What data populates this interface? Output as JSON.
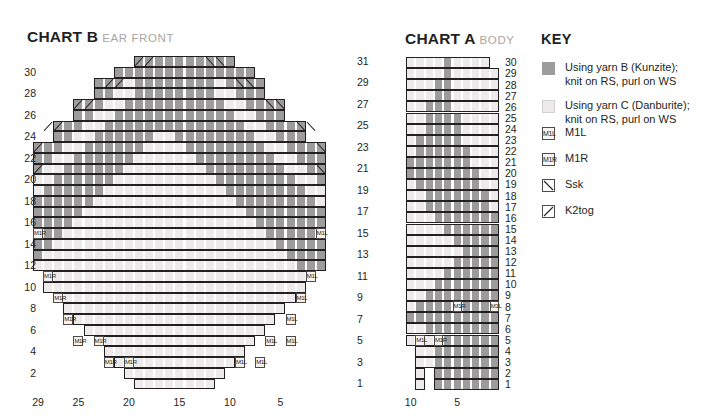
{
  "charts": [
    {
      "id": "chart-b",
      "title_main": "CHART B",
      "title_sub": "EAR FRONT",
      "left_labels": [
        "30",
        "28",
        "26",
        "24",
        "22",
        "20",
        "18",
        "16",
        "14",
        "12",
        "10",
        "8",
        "6",
        "4",
        "2"
      ],
      "right_labels": [
        "31",
        "29",
        "27",
        "25",
        "23",
        "21",
        "19",
        "17",
        "15",
        "13",
        "11",
        "9",
        "7",
        "5",
        "3",
        "1"
      ],
      "bottom_labels": [
        "29",
        "25",
        "20",
        "15",
        "10",
        "5"
      ],
      "columns": 29,
      "rows": 31
    },
    {
      "id": "chart-a",
      "title_main": "CHART A",
      "title_sub": "BODY",
      "right_labels": [
        "30",
        "29",
        "28",
        "27",
        "26",
        "25",
        "24",
        "23",
        "22",
        "21",
        "20",
        "19",
        "18",
        "17",
        "16",
        "15",
        "14",
        "13",
        "12",
        "11",
        "10",
        "9",
        "8",
        "7",
        "6",
        "5",
        "4",
        "3",
        "2",
        "1"
      ],
      "bottom_labels": [
        "10",
        "5"
      ],
      "columns": 10,
      "rows": 30
    }
  ],
  "key": {
    "title": "KEY",
    "items": [
      {
        "swatch": "yarn-b-swatch",
        "label": "Using yarn B (Kunzite);\nknit on RS, purl on WS",
        "line1": "Using yarn B (Kunzite);",
        "line2": "knit on RS, purl on WS"
      },
      {
        "swatch": "yarn-c-swatch",
        "label": "Using yarn C (Danburite);\nknit on RS, purl on WS",
        "line1": "Using yarn C (Danburite);",
        "line2": "knit on RS, purl on WS"
      },
      {
        "swatch": "m1l-symbol",
        "glyph": "M1L",
        "line1": "M1L",
        "line2": ""
      },
      {
        "swatch": "m1r-symbol",
        "glyph": "M1R",
        "line1": "M1R",
        "line2": ""
      },
      {
        "swatch": "ssk-symbol",
        "glyph": "backslash",
        "line1": "Ssk",
        "line2": ""
      },
      {
        "swatch": "k2tog-symbol",
        "glyph": "slash",
        "line1": "K2tog",
        "line2": ""
      }
    ]
  },
  "colors": {
    "yarn_b": "#9c9c9c",
    "yarn_c": "#eceaea",
    "outline": "#231f20",
    "text": "#231f20",
    "subtitle": "#a8a5a3",
    "gridline": "#ffffff"
  },
  "chart_data": {
    "type": "heatmap",
    "legend": [
      "Using yarn B (Kunzite); knit on RS, purl on WS",
      "Using yarn C (Danburite); knit on RS, purl on WS",
      "M1L",
      "M1R",
      "Ssk",
      "K2tog"
    ],
    "charts": [
      {
        "name": "CHART B EAR FRONT",
        "xlabel": "",
        "ylabel": "",
        "columns": 29,
        "rows": 31,
        "xtick_labels": [
          "29",
          "25",
          "20",
          "15",
          "10",
          "5"
        ],
        "xtick_columns": [
          29,
          25,
          20,
          15,
          10,
          5
        ],
        "ytick_left": [
          30,
          28,
          26,
          24,
          22,
          20,
          18,
          16,
          14,
          12,
          10,
          8,
          6,
          4,
          2
        ],
        "ytick_right": [
          31,
          29,
          27,
          25,
          23,
          21,
          19,
          17,
          15,
          13,
          11,
          9,
          7,
          5,
          3,
          1
        ],
        "cell_codes": "B=yarn B (grey), C=yarn C (light), .=outside shape",
        "rows_top_to_bottom": [
          "..........BBBBBBBBBB.........",
          "........BBBBBBBBBBBBBB.......",
          "......BBBCBBBBBBBBCBBBB......",
          "......BBCCBBBBBBBBCCBBB......",
          "....BBBCCBBBBBBBBBBCCBBBB....",
          "....BBCCBBBBBBBBBBBBCCBBB....",
          "..BBBCCBBBBBBBBBBBBBBCCBBBB..",
          "..BBCCBBBBBBCCBBBBBBBBCCBBB..",
          "BBBCCBBBBBBCCCCBBBBBBBBCCBBBB",
          "BBCCBBBBBBCCCCCCBBBBBBBBCCBBB",
          "BCCBBBBBBCCCCCCCCBBBBBBBBCCBB",
          "CCBBBBBBCCCCCCCCCCBBBBBBBBCCB",
          "CBBBBBBCCCCCCCCCCCCBBBBBBBBCC",
          "BBBBBBCCCCCCCCCCCCCCBBBBBBBBC",
          "BBBBBCCCCCCCCCCCCCCCCBBBBBBBB",
          "BBBBCCCCCCCCCCCCCCCCCCBBBBBBB",
          "BBBCCCCCCCCCCCCCCCCCCCCBBBBBB",
          "BBCCCCCCCCCCCCCCCCCCCCCCBBBBB",
          "BCCCCCCCCCCCCCCCCCCCCCCCCBBBB",
          "CCCCCCCCCCCCCCCCCCCCCCCCCCBBB",
          ".CCCCCCCCCCCCCCCCCCCCCCCCCCB.",
          ".CCCCCCCCCCCCCCCCCCCCCCCCCC..",
          "..CCCCCCCCCCCCCCCCCCCCCCCC...",
          "...CCCCCCCCCCCCCCCCCCCCCC....",
          "....CCCCCCCCCCCCCCCCCCCC.....",
          ".....CCCCCCCCCCCCCCCCCC......",
          "......CCCCCCCCCCCCCCCC.......",
          ".......CCCCCCCCCCCCCC........",
          "........CCCCCCCCCCCC.........",
          ".........CCCCCCCCCC..........",
          "..........CCCCCCCC..........."
        ],
        "symbols": [
          {
            "row": 31,
            "col": 19,
            "type": "K2tog"
          },
          {
            "row": 31,
            "col": 18,
            "type": "K2tog"
          },
          {
            "row": 31,
            "col": 12,
            "type": "Ssk"
          },
          {
            "row": 31,
            "col": 11,
            "type": "Ssk"
          },
          {
            "row": 29,
            "col": 22,
            "type": "K2tog"
          },
          {
            "row": 29,
            "col": 21,
            "type": "K2tog"
          },
          {
            "row": 29,
            "col": 9,
            "type": "Ssk"
          },
          {
            "row": 29,
            "col": 8,
            "type": "Ssk"
          },
          {
            "row": 27,
            "col": 25,
            "type": "K2tog"
          },
          {
            "row": 27,
            "col": 24,
            "type": "K2tog"
          },
          {
            "row": 27,
            "col": 6,
            "type": "Ssk"
          },
          {
            "row": 27,
            "col": 5,
            "type": "Ssk"
          },
          {
            "row": 25,
            "col": 28,
            "type": "K2tog"
          },
          {
            "row": 25,
            "col": 27,
            "type": "K2tog"
          },
          {
            "row": 25,
            "col": 3,
            "type": "Ssk"
          },
          {
            "row": 25,
            "col": 2,
            "type": "Ssk"
          },
          {
            "row": 23,
            "col": 29,
            "type": "K2tog"
          },
          {
            "row": 23,
            "col": 1,
            "type": "Ssk"
          },
          {
            "row": 21,
            "col": 29,
            "type": "K2tog"
          },
          {
            "row": 21,
            "col": 1,
            "type": "Ssk"
          },
          {
            "row": 15,
            "col": 29,
            "type": "M1R"
          },
          {
            "row": 15,
            "col": 1,
            "type": "M1L"
          },
          {
            "row": 11,
            "col": 28,
            "type": "M1R"
          },
          {
            "row": 11,
            "col": 2,
            "type": "M1L"
          },
          {
            "row": 9,
            "col": 27,
            "type": "M1R"
          },
          {
            "row": 9,
            "col": 3,
            "type": "M1L"
          },
          {
            "row": 7,
            "col": 26,
            "type": "M1R"
          },
          {
            "row": 7,
            "col": 4,
            "type": "M1L"
          },
          {
            "row": 5,
            "col": 25,
            "type": "M1R"
          },
          {
            "row": 5,
            "col": 23,
            "type": "M1R"
          },
          {
            "row": 5,
            "col": 6,
            "type": "M1L"
          },
          {
            "row": 5,
            "col": 4,
            "type": "M1L"
          },
          {
            "row": 3,
            "col": 22,
            "type": "M1R"
          },
          {
            "row": 3,
            "col": 20,
            "type": "M1R"
          },
          {
            "row": 3,
            "col": 9,
            "type": "M1L"
          },
          {
            "row": 3,
            "col": 7,
            "type": "M1L"
          }
        ]
      },
      {
        "name": "CHART A BODY",
        "columns": 10,
        "rows": 30,
        "xtick_labels": [
          "10",
          "5"
        ],
        "xtick_columns": [
          10,
          5
        ],
        "ytick_right": [
          30,
          29,
          28,
          27,
          26,
          25,
          24,
          23,
          22,
          21,
          20,
          19,
          18,
          17,
          16,
          15,
          14,
          13,
          12,
          11,
          10,
          9,
          8,
          7,
          6,
          5,
          4,
          3,
          2,
          1
        ],
        "rows_top_to_bottom": [
          "CCCCBCCCC.",
          "CCCCBCCCCC",
          "CCCBBCCCCC",
          "CCCBBCCCCC",
          "CCBBBCCCCC",
          "CCBBBBCCCC",
          "CCBBBBCCCC",
          "CBBBBBCCCC",
          "CBBBBBBCCC",
          "BBBBBBBCCC",
          "BBBBBBBBCC",
          "CBBBBBBBCC",
          "CCBBBBBBBC",
          "CCBBBBBBBC",
          "CCCBBBBBBB",
          "CCCCBBBBBB",
          "CCCCCBBBBB",
          "CCCCCCBBBB",
          "CCCCCBBBBB",
          "CCCCBBBBBB",
          "CCCBBBBBBB",
          "CCBBBBBBBB",
          "CBBBBBBBBB",
          "BBBBBBBBBB",
          "CCBBBBBBBB",
          "CCCBBBBBBB",
          ".CCBBBBBBB",
          ".CCBBBBBBB",
          ".C.BBBBBBB",
          ".C.BBBBBBB"
        ],
        "symbols": [
          {
            "row": 8,
            "col": 5,
            "type": "M1R"
          },
          {
            "row": 8,
            "col": 1,
            "type": "M1L"
          },
          {
            "row": 5,
            "col": 9,
            "type": "M1L"
          },
          {
            "row": 5,
            "col": 7,
            "type": "M1R"
          }
        ]
      }
    ]
  }
}
